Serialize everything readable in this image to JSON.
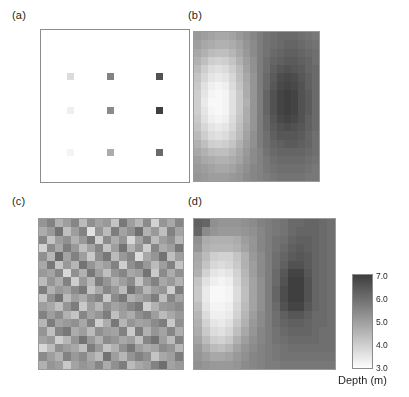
{
  "figure": {
    "panels": [
      {
        "key": "a",
        "label": "(a)",
        "caption_id": "sample-locations"
      },
      {
        "key": "b",
        "label": "(b)",
        "caption_id": "kriged-surface"
      },
      {
        "key": "c",
        "label": "(c)",
        "caption_id": "noise-field"
      },
      {
        "key": "d",
        "label": "(d)",
        "caption_id": "simulated-surface"
      }
    ]
  },
  "colorbar": {
    "title": "Depth (m)",
    "ticks": [
      "7.0",
      "6.0",
      "5.0",
      "4.0",
      "3.0"
    ],
    "vmin": 3.0,
    "vmax": 7.0,
    "orientation": "vertical",
    "colormap": "grayscale-inverted",
    "color_light": "#ffffff",
    "color_dark": "#3f3f3f"
  },
  "chart_data": [
    {
      "type": "scatter",
      "panel": "a",
      "title": "(a)",
      "xlabel": "",
      "ylabel": "",
      "zlabel": "Depth (m)",
      "zlim": [
        3.0,
        7.0
      ],
      "grid": false,
      "background": "#ffffff",
      "marker": "square",
      "points": [
        {
          "x": 3,
          "y": 12,
          "value": 3.7
        },
        {
          "x": 8,
          "y": 12,
          "value": 5.6
        },
        {
          "x": 14,
          "y": 12,
          "value": 6.6
        },
        {
          "x": 3,
          "y": 8,
          "value": 3.3
        },
        {
          "x": 8,
          "y": 8,
          "value": 5.4
        },
        {
          "x": 14,
          "y": 8,
          "value": 7.0
        },
        {
          "x": 3,
          "y": 3,
          "value": 3.2
        },
        {
          "x": 8,
          "y": 3,
          "value": 4.7
        },
        {
          "x": 14,
          "y": 3,
          "value": 6.1
        }
      ]
    },
    {
      "type": "heatmap",
      "panel": "b",
      "title": "(b)",
      "xlabel": "",
      "ylabel": "",
      "zlabel": "Depth (m)",
      "zlim": [
        3.0,
        7.0
      ],
      "grid": false,
      "nx": 18,
      "ny": 18,
      "description": "Smooth kriged depth surface: light (shallow ~3.2 m) lobe left-of-centre, dark (deep ~7.0 m) lobe right-of-centre",
      "values": [
        [
          5.1,
          5.0,
          4.9,
          4.8,
          4.8,
          4.9,
          5.1,
          5.3,
          5.5,
          5.7,
          5.9,
          6.0,
          6.1,
          6.1,
          6.1,
          6.0,
          5.9,
          5.8
        ],
        [
          5.0,
          4.8,
          4.7,
          4.6,
          4.6,
          4.7,
          4.9,
          5.2,
          5.4,
          5.7,
          5.9,
          6.0,
          6.1,
          6.2,
          6.2,
          6.1,
          6.0,
          5.9
        ],
        [
          4.8,
          4.6,
          4.4,
          4.3,
          4.3,
          4.5,
          4.8,
          5.1,
          5.4,
          5.7,
          5.9,
          6.1,
          6.2,
          6.3,
          6.3,
          6.2,
          6.1,
          6.0
        ],
        [
          4.6,
          4.3,
          4.0,
          3.9,
          4.0,
          4.2,
          4.6,
          5.0,
          5.3,
          5.7,
          6.0,
          6.2,
          6.3,
          6.4,
          6.4,
          6.3,
          6.2,
          6.0
        ],
        [
          4.4,
          4.0,
          3.7,
          3.6,
          3.7,
          4.0,
          4.4,
          4.9,
          5.3,
          5.7,
          6.0,
          6.3,
          6.5,
          6.6,
          6.5,
          6.4,
          6.2,
          6.1
        ],
        [
          4.2,
          3.8,
          3.5,
          3.4,
          3.5,
          3.8,
          4.3,
          4.8,
          5.2,
          5.7,
          6.1,
          6.4,
          6.7,
          6.8,
          6.7,
          6.5,
          6.3,
          6.1
        ],
        [
          4.1,
          3.6,
          3.3,
          3.2,
          3.3,
          3.7,
          4.2,
          4.7,
          5.2,
          5.7,
          6.1,
          6.5,
          6.8,
          6.9,
          6.8,
          6.6,
          6.3,
          6.1
        ],
        [
          4.0,
          3.5,
          3.2,
          3.1,
          3.2,
          3.6,
          4.1,
          4.7,
          5.2,
          5.7,
          6.2,
          6.6,
          6.9,
          7.0,
          6.9,
          6.6,
          6.4,
          6.1
        ],
        [
          4.0,
          3.4,
          3.1,
          3.1,
          3.2,
          3.6,
          4.1,
          4.6,
          5.2,
          5.7,
          6.2,
          6.6,
          6.9,
          7.0,
          6.9,
          6.6,
          6.4,
          6.1
        ],
        [
          4.0,
          3.5,
          3.2,
          3.1,
          3.2,
          3.6,
          4.1,
          4.7,
          5.2,
          5.7,
          6.2,
          6.6,
          6.9,
          7.0,
          6.9,
          6.6,
          6.4,
          6.1
        ],
        [
          4.1,
          3.6,
          3.3,
          3.2,
          3.3,
          3.7,
          4.2,
          4.7,
          5.2,
          5.7,
          6.1,
          6.5,
          6.8,
          6.9,
          6.8,
          6.6,
          6.3,
          6.1
        ],
        [
          4.2,
          3.8,
          3.5,
          3.4,
          3.5,
          3.8,
          4.3,
          4.8,
          5.2,
          5.7,
          6.1,
          6.4,
          6.6,
          6.7,
          6.6,
          6.5,
          6.3,
          6.1
        ],
        [
          4.4,
          4.0,
          3.7,
          3.6,
          3.7,
          4.0,
          4.4,
          4.9,
          5.3,
          5.7,
          6.0,
          6.3,
          6.5,
          6.5,
          6.5,
          6.4,
          6.2,
          6.0
        ],
        [
          4.6,
          4.3,
          4.0,
          3.9,
          4.0,
          4.2,
          4.6,
          5.0,
          5.3,
          5.7,
          6.0,
          6.2,
          6.3,
          6.4,
          6.4,
          6.3,
          6.2,
          6.0
        ],
        [
          4.8,
          4.6,
          4.4,
          4.3,
          4.3,
          4.5,
          4.8,
          5.1,
          5.4,
          5.6,
          5.9,
          6.1,
          6.2,
          6.2,
          6.2,
          6.2,
          6.1,
          6.0
        ],
        [
          5.0,
          4.8,
          4.7,
          4.6,
          4.6,
          4.7,
          4.9,
          5.2,
          5.4,
          5.6,
          5.8,
          6.0,
          6.1,
          6.1,
          6.1,
          6.1,
          6.0,
          5.9
        ],
        [
          5.1,
          5.0,
          4.9,
          4.8,
          4.8,
          4.9,
          5.1,
          5.3,
          5.5,
          5.6,
          5.8,
          5.9,
          6.0,
          6.0,
          6.0,
          6.0,
          5.9,
          5.8
        ],
        [
          5.2,
          5.1,
          5.0,
          5.0,
          5.0,
          5.1,
          5.2,
          5.4,
          5.5,
          5.6,
          5.7,
          5.8,
          5.9,
          5.9,
          5.9,
          5.9,
          5.8,
          5.8
        ]
      ]
    },
    {
      "type": "heatmap",
      "panel": "c",
      "title": "(c)",
      "xlabel": "",
      "ylabel": "",
      "zlabel": "Depth (m)",
      "zlim": [
        3.0,
        7.0
      ],
      "grid": false,
      "nx": 18,
      "ny": 18,
      "description": "Uncorrelated random noise field (white noise residual), mean ~5.0 m",
      "values": [
        [
          5.2,
          5.6,
          4.6,
          5.0,
          5.5,
          4.4,
          5.3,
          4.9,
          5.1,
          4.2,
          5.8,
          5.0,
          4.5,
          5.4,
          3.9,
          5.2,
          4.8,
          5.5
        ],
        [
          4.7,
          5.1,
          5.9,
          4.3,
          5.0,
          5.6,
          3.6,
          5.2,
          4.4,
          5.7,
          4.9,
          5.3,
          6.0,
          4.6,
          5.1,
          4.3,
          5.6,
          4.9
        ],
        [
          5.5,
          4.2,
          5.0,
          5.3,
          4.6,
          5.1,
          5.8,
          4.0,
          5.4,
          4.7,
          5.2,
          3.8,
          4.9,
          5.6,
          4.4,
          5.0,
          5.3,
          4.5
        ],
        [
          3.9,
          5.4,
          4.8,
          5.7,
          5.1,
          4.3,
          4.9,
          5.5,
          4.2,
          5.0,
          5.9,
          4.6,
          5.2,
          4.0,
          5.5,
          4.7,
          5.0,
          5.8
        ],
        [
          5.3,
          4.5,
          6.1,
          4.9,
          5.6,
          5.0,
          4.1,
          5.3,
          5.8,
          4.4,
          5.1,
          5.5,
          3.7,
          4.8,
          5.2,
          5.9,
          4.3,
          5.0
        ],
        [
          4.8,
          5.8,
          4.2,
          5.1,
          4.5,
          5.9,
          5.2,
          4.7,
          5.0,
          5.6,
          4.0,
          5.3,
          5.7,
          5.1,
          4.4,
          5.0,
          5.6,
          4.2
        ],
        [
          5.1,
          4.9,
          5.5,
          3.8,
          5.3,
          4.6,
          5.8,
          5.0,
          4.3,
          5.2,
          5.5,
          4.8,
          5.0,
          5.9,
          4.1,
          5.4,
          4.7,
          5.3
        ],
        [
          4.4,
          5.2,
          4.7,
          5.6,
          4.0,
          5.1,
          4.5,
          5.7,
          5.2,
          4.6,
          5.0,
          5.4,
          4.2,
          5.1,
          5.6,
          4.8,
          5.1,
          4.6
        ],
        [
          5.7,
          4.6,
          5.1,
          4.9,
          5.4,
          5.8,
          4.2,
          4.8,
          5.5,
          5.1,
          4.4,
          5.9,
          5.3,
          4.5,
          5.0,
          5.2,
          4.0,
          5.7
        ],
        [
          4.2,
          5.3,
          5.9,
          4.4,
          5.0,
          4.7,
          5.3,
          5.6,
          4.1,
          5.4,
          5.8,
          4.6,
          4.9,
          5.2,
          5.7,
          4.3,
          5.5,
          4.9
        ],
        [
          5.0,
          4.8,
          4.3,
          5.2,
          5.7,
          4.1,
          5.0,
          4.5,
          5.3,
          4.9,
          5.1,
          5.5,
          5.8,
          4.0,
          4.6,
          5.1,
          5.2,
          5.4
        ],
        [
          5.6,
          5.0,
          5.4,
          4.6,
          4.2,
          5.5,
          4.9,
          5.2,
          5.7,
          4.3,
          5.0,
          4.7,
          5.3,
          5.6,
          5.0,
          4.4,
          4.8,
          5.1
        ],
        [
          4.5,
          5.7,
          4.9,
          5.1,
          5.3,
          4.8,
          5.6,
          4.0,
          4.7,
          5.8,
          4.5,
          5.2,
          4.9,
          5.0,
          5.4,
          5.7,
          4.1,
          5.3
        ],
        [
          5.2,
          4.3,
          5.5,
          5.8,
          4.7,
          5.0,
          4.4,
          5.3,
          5.0,
          4.9,
          5.6,
          4.1,
          5.7,
          4.6,
          5.2,
          4.9,
          5.5,
          4.7
        ],
        [
          4.9,
          5.1,
          4.0,
          4.5,
          5.2,
          5.9,
          5.1,
          4.6,
          5.4,
          5.2,
          4.8,
          5.0,
          4.3,
          5.5,
          5.9,
          5.0,
          4.4,
          5.6
        ],
        [
          3.8,
          4.4,
          5.3,
          5.0,
          4.8,
          4.3,
          5.7,
          5.1,
          4.2,
          4.6,
          5.3,
          5.8,
          5.0,
          4.7,
          4.9,
          5.4,
          5.2,
          4.5
        ],
        [
          5.4,
          5.0,
          4.6,
          5.6,
          5.1,
          5.4,
          4.8,
          4.4,
          5.9,
          5.0,
          4.5,
          5.2,
          5.6,
          5.3,
          4.2,
          4.8,
          5.0,
          5.7
        ],
        [
          4.6,
          5.2,
          5.0,
          4.1,
          4.9,
          5.2,
          5.0,
          5.5,
          4.7,
          5.3,
          5.7,
          4.4,
          4.8,
          5.0,
          5.6,
          6.0,
          4.9,
          5.1
        ]
      ]
    },
    {
      "type": "heatmap",
      "panel": "d",
      "title": "(d)",
      "xlabel": "",
      "ylabel": "",
      "zlabel": "Depth (m)",
      "zlim": [
        3.0,
        7.0
      ],
      "grid": false,
      "nx": 18,
      "ny": 18,
      "description": "Conditional simulation: blockier version of the kriged surface retaining the shallow left lobe and deep right lobe",
      "values": [
        [
          6.3,
          6.2,
          5.3,
          5.2,
          5.2,
          5.2,
          5.3,
          5.4,
          5.6,
          5.7,
          5.8,
          5.9,
          6.1,
          6.1,
          6.2,
          6.2,
          6.1,
          6.0
        ],
        [
          6.2,
          5.4,
          5.2,
          5.1,
          5.1,
          5.1,
          5.2,
          5.3,
          5.5,
          5.7,
          5.8,
          5.9,
          6.1,
          6.2,
          6.2,
          6.2,
          6.1,
          6.0
        ],
        [
          5.3,
          4.7,
          4.6,
          4.6,
          4.6,
          4.7,
          5.0,
          5.2,
          5.5,
          5.7,
          5.9,
          6.0,
          6.2,
          6.3,
          6.3,
          6.2,
          6.1,
          6.0
        ],
        [
          5.2,
          4.6,
          4.5,
          4.5,
          4.5,
          4.6,
          4.9,
          5.2,
          5.5,
          5.7,
          5.9,
          6.1,
          6.3,
          6.4,
          6.3,
          6.2,
          6.1,
          6.0
        ],
        [
          4.8,
          4.4,
          4.0,
          3.9,
          3.9,
          4.2,
          4.6,
          5.1,
          5.4,
          5.7,
          6.0,
          6.2,
          6.4,
          6.5,
          6.4,
          6.2,
          6.1,
          6.0
        ],
        [
          4.7,
          4.2,
          3.8,
          3.7,
          3.8,
          4.1,
          4.6,
          5.0,
          5.4,
          5.7,
          6.0,
          6.3,
          6.6,
          6.6,
          6.4,
          6.2,
          6.1,
          6.0
        ],
        [
          4.6,
          3.9,
          3.5,
          3.4,
          3.5,
          3.9,
          4.5,
          5.0,
          5.4,
          5.7,
          6.1,
          6.5,
          6.9,
          6.9,
          6.5,
          6.2,
          6.1,
          6.0
        ],
        [
          4.2,
          3.6,
          3.3,
          3.2,
          3.3,
          3.8,
          4.4,
          4.9,
          5.3,
          5.7,
          6.1,
          6.6,
          7.0,
          7.0,
          6.6,
          6.2,
          6.1,
          6.0
        ],
        [
          4.1,
          3.4,
          3.1,
          3.1,
          3.2,
          3.7,
          4.3,
          4.9,
          5.3,
          5.7,
          6.2,
          6.7,
          7.0,
          7.0,
          6.6,
          6.2,
          6.1,
          6.0
        ],
        [
          4.1,
          3.4,
          3.1,
          3.1,
          3.2,
          3.7,
          4.3,
          4.9,
          5.3,
          5.7,
          6.2,
          6.7,
          7.0,
          7.0,
          6.6,
          6.2,
          6.1,
          6.0
        ],
        [
          4.3,
          3.5,
          3.2,
          3.2,
          3.3,
          3.8,
          4.4,
          4.9,
          5.3,
          5.7,
          6.1,
          6.6,
          6.9,
          6.9,
          6.5,
          6.2,
          6.1,
          6.0
        ],
        [
          4.5,
          3.7,
          3.3,
          3.3,
          3.4,
          3.9,
          4.5,
          5.0,
          5.4,
          5.7,
          6.0,
          6.3,
          6.5,
          6.5,
          6.3,
          6.1,
          6.1,
          6.0
        ],
        [
          4.6,
          3.9,
          3.5,
          3.4,
          3.6,
          4.1,
          4.6,
          5.1,
          5.4,
          5.7,
          6.0,
          6.2,
          6.3,
          6.3,
          6.2,
          6.1,
          6.1,
          6.0
        ],
        [
          4.7,
          4.1,
          3.7,
          3.6,
          3.8,
          4.3,
          4.8,
          5.2,
          5.5,
          5.7,
          5.9,
          6.1,
          6.2,
          6.2,
          6.2,
          6.1,
          6.0,
          6.0
        ],
        [
          4.9,
          4.4,
          4.0,
          3.9,
          4.1,
          4.6,
          5.0,
          5.3,
          5.5,
          5.7,
          5.9,
          6.0,
          6.1,
          6.1,
          6.1,
          6.1,
          6.0,
          6.0
        ],
        [
          5.1,
          4.7,
          4.4,
          4.3,
          4.5,
          4.9,
          5.2,
          5.4,
          5.6,
          5.7,
          5.8,
          5.9,
          6.0,
          6.0,
          6.0,
          6.0,
          6.0,
          6.0
        ],
        [
          5.2,
          5.0,
          4.8,
          4.8,
          4.9,
          5.1,
          5.3,
          5.5,
          5.6,
          5.7,
          5.8,
          5.9,
          5.9,
          5.9,
          5.9,
          5.9,
          5.9,
          5.9
        ],
        [
          5.3,
          5.2,
          5.1,
          5.1,
          5.1,
          5.2,
          5.4,
          5.5,
          5.6,
          5.7,
          5.7,
          5.8,
          5.8,
          5.8,
          5.8,
          5.8,
          5.8,
          5.8
        ]
      ]
    }
  ]
}
